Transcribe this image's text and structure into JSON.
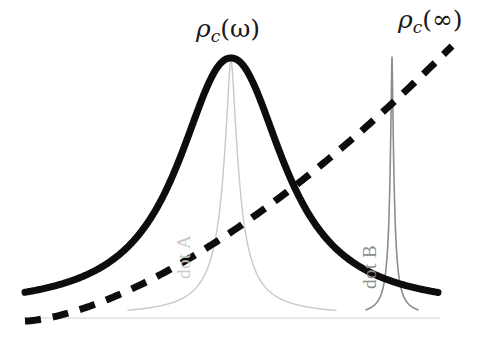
{
  "figure": {
    "title": "",
    "background_color": "#ffffff",
    "width": 480,
    "height": 340
  },
  "labels": {
    "rho_omega": {
      "rho": "ρ",
      "sub": "c",
      "arg": "(ω)",
      "full": "ρc(ω)",
      "color": "#1a1a1a"
    },
    "rho_infinity": {
      "rho": "ρ",
      "sub": "c",
      "arg": "(∞)",
      "full": "ρc(∞)",
      "color": "#1a1a1a"
    },
    "dot_a": {
      "text": "dot A",
      "color": "#c9c9c9"
    },
    "dot_b": {
      "text": "dot B",
      "color": "#8c8c8c"
    }
  },
  "chart_data": {
    "type": "line",
    "title": "",
    "xlabel": "",
    "ylabel": "",
    "xlim": [
      0,
      480
    ],
    "ylim": [
      340,
      0
    ],
    "grid": false,
    "legend": "inline-annotations",
    "axes_visible": false,
    "baseline": {
      "y": 318,
      "x_start": 25,
      "x_end": 440,
      "color": "#d2d2d2",
      "width": 1
    },
    "series": [
      {
        "name": "rho_c(omega) broad resonance",
        "style": "solid",
        "color": "#0d0d0d",
        "line_width": 7,
        "peak_x": 231,
        "peak_y": 58,
        "baseline_y": 310,
        "half_width": 62,
        "x_start": 25,
        "x_end": 438,
        "annotation": "ρc(ω)"
      },
      {
        "name": "rho_c(infinity) dashed rising",
        "style": "dashed",
        "color": "#0d0d0d",
        "line_width": 7,
        "dash_pattern": "16 12",
        "x_start": 25,
        "y_start": 321,
        "x_end": 452,
        "y_end": 46,
        "annotation": "ρc(∞)"
      },
      {
        "name": "dot A narrow resonance",
        "style": "solid",
        "color": "#c9c9c9",
        "line_width": 1.4,
        "peak_x": 231,
        "peak_y": 58,
        "baseline_y": 316,
        "half_width": 9,
        "tail_x_start": 128,
        "tail_x_end": 336,
        "annotation": "dot A"
      },
      {
        "name": "dot B sharp resonance",
        "style": "solid",
        "color": "#8c8c8c",
        "line_width": 1.6,
        "peak_x": 392,
        "peak_y": 57,
        "baseline_y": 316,
        "half_width": 2.2,
        "annotation": "dot B"
      }
    ]
  }
}
